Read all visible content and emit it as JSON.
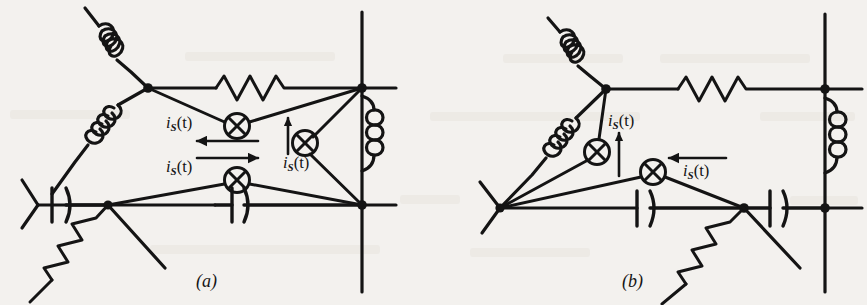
{
  "figure": {
    "kind": "electrical-circuit-diagram",
    "background_color": "#f3f1ee",
    "ink_color": "#141414",
    "width": 867,
    "height": 305,
    "panels": [
      {
        "id": "a",
        "caption": "(a)",
        "caption_x": 196,
        "caption_y": 272,
        "current_labels": [
          {
            "name": "source-label-upper-left",
            "text_i": "i",
            "text_sub": "S",
            "text_paren": "(t)",
            "x": 166,
            "y": 115
          },
          {
            "name": "source-label-lower-left",
            "text_i": "i",
            "text_sub": "S",
            "text_paren": "(t)",
            "x": 166,
            "y": 159
          },
          {
            "name": "source-label-right",
            "text_i": "i",
            "text_sub": "S",
            "text_paren": "(t)",
            "x": 283,
            "y": 155
          }
        ],
        "components": {
          "inductors": [
            "upper-left-diagonal-inductor",
            "lower-left-diagonal-inductor",
            "right-vertical-inductor"
          ],
          "resistors": [
            "top-horizontal-resistor",
            "bottom-left-diagonal-resistor"
          ],
          "capacitors": [
            "left-bottom-capacitor",
            "middle-bottom-capacitor"
          ],
          "current_sources": [
            "source-upper",
            "source-lower",
            "source-right"
          ],
          "arrows": [
            "arrow-left-upper",
            "arrow-right-lower",
            "arrow-up-right"
          ]
        }
      },
      {
        "id": "b",
        "caption": "(b)",
        "caption_x": 622,
        "caption_y": 272,
        "current_labels": [
          {
            "name": "source-label-upper",
            "text_i": "i",
            "text_sub": "S",
            "text_paren": "(t)",
            "x": 608,
            "y": 113
          },
          {
            "name": "source-label-right",
            "text_i": "i",
            "text_sub": "S",
            "text_paren": "(t)",
            "x": 683,
            "y": 163
          }
        ],
        "components": {
          "inductors": [
            "upper-left-diagonal-inductor",
            "lower-left-diagonal-inductor",
            "right-vertical-inductor"
          ],
          "resistors": [
            "top-horizontal-resistor",
            "bottom-right-diagonal-resistor"
          ],
          "capacitors": [
            "middle-bottom-capacitor",
            "right-bottom-capacitor"
          ],
          "current_sources": [
            "source-upper",
            "source-lower"
          ],
          "arrows": [
            "arrow-up",
            "arrow-left"
          ]
        }
      }
    ]
  }
}
